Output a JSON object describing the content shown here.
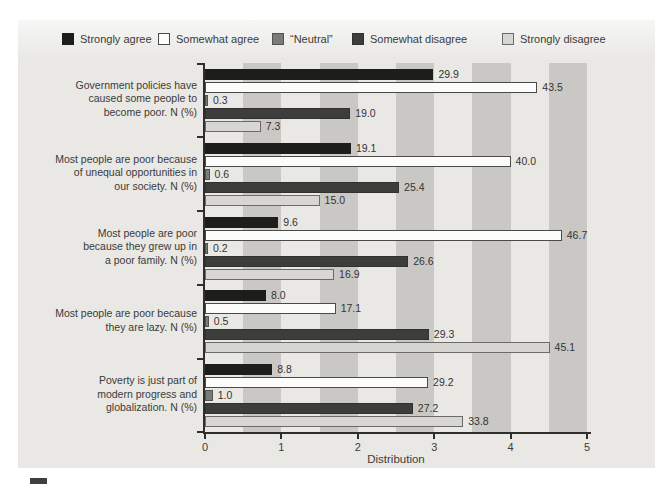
{
  "chart_data": {
    "type": "bar",
    "orientation": "horizontal",
    "title": "",
    "xlabel": "Distribution",
    "xlim": [
      0,
      5
    ],
    "x_ticks": [
      "0",
      "1",
      "2",
      "3",
      "4",
      "5"
    ],
    "grid": "alternating vertical gray bands, 0.5-unit wide, from 0.5 to 5.0",
    "legend_position": "top",
    "scale_note": "bars are drawn at value/10 on the 0-5 axis; labels show N (%) values",
    "categories": [
      "Government policies have\ncaused some people to\nbecome poor. N (%)",
      "Most people are poor because\nof unequal opportunities in\nour society. N (%)",
      "Most people are poor\nbecause they grew up in\na poor family. N (%)",
      "Most people are poor because\nthey are lazy. N (%)",
      "Poverty is just part of\nmodern progress and\nglobalization. N (%)"
    ],
    "series": [
      {
        "name": "Strongly agree",
        "values": [
          29.9,
          19.1,
          9.6,
          8.0,
          8.8
        ]
      },
      {
        "name": "Somewhat agree",
        "values": [
          43.5,
          40.0,
          46.7,
          17.1,
          29.2
        ]
      },
      {
        "name": "“Neutral”",
        "values": [
          0.3,
          0.6,
          0.2,
          0.5,
          1.0
        ]
      },
      {
        "name": "Somewhat disagree",
        "values": [
          19.0,
          25.4,
          26.6,
          29.3,
          27.2
        ]
      },
      {
        "name": "Strongly disagree",
        "values": [
          7.3,
          15.0,
          16.9,
          45.1,
          33.8
        ]
      }
    ]
  },
  "legend": {
    "items": [
      {
        "label": "Strongly agree"
      },
      {
        "label": "Somewhat agree"
      },
      {
        "label": "“Neutral”"
      },
      {
        "label": "Somewhat disagree"
      },
      {
        "label": "Strongly disagree"
      }
    ]
  },
  "colors": {
    "panel_bg": "#e9e8e5",
    "stripe": "#c9c8c4",
    "axis": "#2e2e2c",
    "text": "#3d3d3b",
    "series": [
      {
        "fill": "#1d1d1b",
        "border": "#1d1d1b"
      },
      {
        "fill": "#fcfcfa",
        "border": "#4a4a48"
      },
      {
        "fill": "#7b7b79",
        "border": "#51514f"
      },
      {
        "fill": "#3d3d3b",
        "border": "#31312f"
      },
      {
        "fill": "#d7d6d2",
        "border": "#6b6b69"
      }
    ]
  }
}
